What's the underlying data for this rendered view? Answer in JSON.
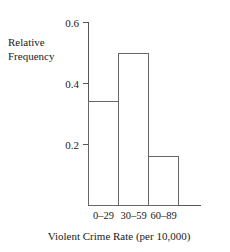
{
  "chart_data": {
    "type": "bar",
    "title": "",
    "subtitle": "",
    "categories": [
      "0–29",
      "30–59",
      "60–89"
    ],
    "values": [
      0.34,
      0.5,
      0.16
    ],
    "xlabel": "Violent Crime Rate (per 10,000)",
    "ylabel_line1": "Relative",
    "ylabel_line2": "Frequency",
    "ylabel": "Relative Frequency",
    "ylim": [
      0,
      0.6
    ],
    "yticks": [
      0.2,
      0.4,
      0.6
    ],
    "ytick_labels": [
      "0.2",
      "0.4",
      "0.6"
    ],
    "grid": false,
    "legend": false,
    "legend_position": "none",
    "bar_fill": "none",
    "bar_stroke": "#666666",
    "axis_color": "#555555",
    "background": "#ffffff",
    "annotations": []
  }
}
